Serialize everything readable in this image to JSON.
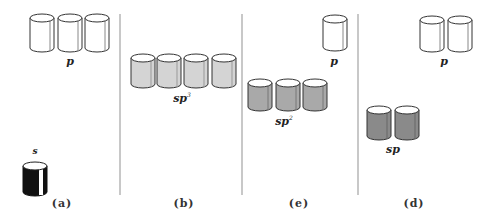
{
  "diagram": {
    "type": "orbital hybridization schematic (cylinders)",
    "colors": {
      "p_orbital": "#ffffff",
      "s_orbital": "#111111",
      "sp3_orbital": "#d4d4d4",
      "sp2_orbital": "#a9a9a9",
      "sp_orbital": "#8a8a8a",
      "divider": "#c8c8c8"
    },
    "panels": [
      {
        "label": "(a)",
        "groups": [
          {
            "name": "p",
            "sup": "",
            "count": 3,
            "fill": "p_orbital"
          },
          {
            "name": "s",
            "sup": "",
            "count": 1,
            "fill": "s_orbital"
          }
        ]
      },
      {
        "label": "(b)",
        "groups": [
          {
            "name": "sp",
            "sup": "3",
            "count": 4,
            "fill": "sp3_orbital"
          }
        ]
      },
      {
        "label": "(e)",
        "groups": [
          {
            "name": "p",
            "sup": "",
            "count": 1,
            "fill": "p_orbital"
          },
          {
            "name": "sp",
            "sup": "2",
            "count": 3,
            "fill": "sp2_orbital"
          }
        ]
      },
      {
        "label": "(d)",
        "groups": [
          {
            "name": "p",
            "sup": "",
            "count": 2,
            "fill": "p_orbital"
          },
          {
            "name": "sp",
            "sup": "",
            "count": 2,
            "fill": "sp_orbital"
          }
        ]
      }
    ]
  }
}
